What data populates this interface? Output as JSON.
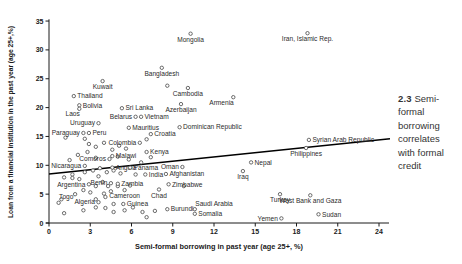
{
  "caption": {
    "number": "2.3",
    "text": "Semi-formal borrowing correlates with formal credit"
  },
  "colors": {
    "axis": "#1a1a1a",
    "tick_text": "#1a1a1a",
    "point_stroke": "#5a5a5a",
    "point_fill": "#ffffff",
    "label_text": "#2b2b2b",
    "trend_line": "#000000",
    "caption_text": "#333333"
  },
  "chart_data": {
    "type": "scatter",
    "title": "",
    "xlabel": "Semi-formal borrowing in past year (age 25+, %)",
    "ylabel": "Loan from a financial institution in the past year (age 25+,%)",
    "xlim": [
      0,
      24
    ],
    "ylim": [
      0,
      35
    ],
    "xticks": [
      0,
      3,
      6,
      9,
      12,
      15,
      18,
      21,
      24
    ],
    "yticks": [
      0,
      5,
      10,
      15,
      20,
      25,
      30,
      35
    ],
    "grid": false,
    "legend": "none",
    "trendline": {
      "x_start": 0,
      "y_start": 8.5,
      "x_end": 24.8,
      "y_end": 14.6
    },
    "points": [
      {
        "name": "Mongolia",
        "x": 10.3,
        "y": 32.8,
        "pos": "below"
      },
      {
        "name": "Iran, Islamic Rep.",
        "x": 18.8,
        "y": 32.9,
        "pos": "below"
      },
      {
        "name": "Bangladesh",
        "x": 8.2,
        "y": 26.9,
        "pos": "below"
      },
      {
        "name": "Kuwait",
        "x": 3.9,
        "y": 24.6,
        "pos": "below"
      },
      {
        "name": "Cambodia",
        "x": 10.1,
        "y": 23.4,
        "pos": "below"
      },
      {
        "name": "Thailand",
        "x": 1.8,
        "y": 22.0,
        "pos": "right"
      },
      {
        "name": "Armenia",
        "x": 13.4,
        "y": 21.8,
        "pos": "below-left"
      },
      {
        "name": "Azerbaijan",
        "x": 9.6,
        "y": 20.6,
        "pos": "below"
      },
      {
        "name": "Bolivia",
        "x": 2.2,
        "y": 20.4,
        "pos": "right"
      },
      {
        "name": "Laos",
        "x": 2.2,
        "y": 19.8,
        "pos": "below-left"
      },
      {
        "name": "Sri Lanka",
        "x": 5.3,
        "y": 19.9,
        "pos": "right"
      },
      {
        "name": "Belarus",
        "x": 6.3,
        "y": 18.4,
        "pos": "left"
      },
      {
        "name": "Vietnam",
        "x": 6.7,
        "y": 18.4,
        "pos": "right"
      },
      {
        "name": "Uruguay",
        "x": 3.6,
        "y": 17.3,
        "pos": "left"
      },
      {
        "name": "Mauritius",
        "x": 5.8,
        "y": 16.5,
        "pos": "right"
      },
      {
        "name": "Dominican Republic",
        "x": 9.5,
        "y": 16.6,
        "pos": "right"
      },
      {
        "name": "Paraguay",
        "x": 2.5,
        "y": 15.6,
        "pos": "left"
      },
      {
        "name": "Peru",
        "x": 2.9,
        "y": 15.6,
        "pos": "right"
      },
      {
        "name": "Croatia",
        "x": 7.4,
        "y": 15.4,
        "pos": "right"
      },
      {
        "name": "Colombia",
        "x": 6.6,
        "y": 13.9,
        "pos": "left"
      },
      {
        "name": "Kenya",
        "x": 7.1,
        "y": 12.3,
        "pos": "right"
      },
      {
        "name": "Malawi",
        "x": 4.6,
        "y": 11.6,
        "pos": "right"
      },
      {
        "name": "Comoros",
        "x": 4.4,
        "y": 11.1,
        "pos": "left"
      },
      {
        "name": "Oman",
        "x": 9.7,
        "y": 9.7,
        "pos": "left"
      },
      {
        "name": "Nicaragua",
        "x": 2.6,
        "y": 9.9,
        "pos": "left"
      },
      {
        "name": "Angola",
        "x": 4.6,
        "y": 9.6,
        "pos": "right"
      },
      {
        "name": "Panama",
        "x": 5.9,
        "y": 9.6,
        "pos": "right"
      },
      {
        "name": "India",
        "x": 7.0,
        "y": 8.4,
        "pos": "right"
      },
      {
        "name": "Afghanistan",
        "x": 8.5,
        "y": 8.5,
        "pos": "right"
      },
      {
        "name": "Argentina",
        "x": 2.9,
        "y": 6.7,
        "pos": "left"
      },
      {
        "name": "Benin",
        "x": 4.5,
        "y": 6.9,
        "pos": "left"
      },
      {
        "name": "Zambia",
        "x": 5.0,
        "y": 6.8,
        "pos": "right"
      },
      {
        "name": "Zimbabwe",
        "x": 8.7,
        "y": 6.7,
        "pos": "right"
      },
      {
        "name": "Cameroon",
        "x": 5.5,
        "y": 5.7,
        "pos": "below"
      },
      {
        "name": "Chad",
        "x": 8.0,
        "y": 5.8,
        "pos": "below"
      },
      {
        "name": "Togo",
        "x": 0.7,
        "y": 3.5,
        "pos": "above-right"
      },
      {
        "name": "Algeria",
        "x": 3.6,
        "y": 3.6,
        "pos": "left"
      },
      {
        "name": "Guinea",
        "x": 5.4,
        "y": 3.3,
        "pos": "right"
      },
      {
        "name": "Burundi",
        "x": 8.6,
        "y": 2.4,
        "pos": "right"
      },
      {
        "name": "Saudi Arabia",
        "x": 10.6,
        "y": 2.4,
        "pos": "above-right"
      },
      {
        "name": "Somalia",
        "x": 10.6,
        "y": 1.6,
        "pos": "right"
      },
      {
        "name": "Nepal",
        "x": 14.7,
        "y": 10.5,
        "pos": "right"
      },
      {
        "name": "Iraq",
        "x": 14.1,
        "y": 9.0,
        "pos": "below"
      },
      {
        "name": "Syrian Arab Republic",
        "x": 18.9,
        "y": 14.4,
        "pos": "right"
      },
      {
        "name": "Philippines",
        "x": 18.7,
        "y": 13.0,
        "pos": "below"
      },
      {
        "name": "Turkey",
        "x": 16.8,
        "y": 5.0,
        "pos": "below"
      },
      {
        "name": "West Bank and Gaza",
        "x": 19.0,
        "y": 4.8,
        "pos": "below"
      },
      {
        "name": "Yemen",
        "x": 16.9,
        "y": 0.8,
        "pos": "left"
      },
      {
        "name": "Sudan",
        "x": 19.6,
        "y": 1.5,
        "pos": "right"
      }
    ],
    "unlabeled_points": [
      [
        8.6,
        23.8
      ],
      [
        7.1,
        14.5
      ],
      [
        1.2,
        14.8
      ],
      [
        2.6,
        14.6
      ],
      [
        2.9,
        13.7
      ],
      [
        3.4,
        13.2
      ],
      [
        4.0,
        13.9
      ],
      [
        4.6,
        12.7
      ],
      [
        5.1,
        13.4
      ],
      [
        5.6,
        12.9
      ],
      [
        2.8,
        12.3
      ],
      [
        2.1,
        11.8
      ],
      [
        1.5,
        10.9
      ],
      [
        3.4,
        11.3
      ],
      [
        5.0,
        11.5
      ],
      [
        5.8,
        11.0
      ],
      [
        6.7,
        10.5
      ],
      [
        7.4,
        11.4
      ],
      [
        3.7,
        9.5
      ],
      [
        3.2,
        9.1
      ],
      [
        2.6,
        8.8
      ],
      [
        1.7,
        8.4
      ],
      [
        4.2,
        8.8
      ],
      [
        4.7,
        9.1
      ],
      [
        5.2,
        8.6
      ],
      [
        6.3,
        8.4
      ],
      [
        1.1,
        7.9
      ],
      [
        3.6,
        8.1
      ],
      [
        1.7,
        7.8
      ],
      [
        2.2,
        7.6
      ],
      [
        3.9,
        7.1
      ],
      [
        3.4,
        6.4
      ],
      [
        4.3,
        6.4
      ],
      [
        5.0,
        6.4
      ],
      [
        5.9,
        6.5
      ],
      [
        4.5,
        5.5
      ],
      [
        4.0,
        5.1
      ],
      [
        3.0,
        5.3
      ],
      [
        2.5,
        5.7
      ],
      [
        1.9,
        5.0
      ],
      [
        9.8,
        6.4
      ],
      [
        0.9,
        4.1
      ],
      [
        3.4,
        4.1
      ],
      [
        4.1,
        4.5
      ],
      [
        4.7,
        3.3
      ],
      [
        3.4,
        2.7
      ],
      [
        2.5,
        2.2
      ],
      [
        1.1,
        1.7
      ],
      [
        4.1,
        2.6
      ],
      [
        4.7,
        1.9
      ],
      [
        5.5,
        2.2
      ],
      [
        6.1,
        2.7
      ],
      [
        6.8,
        1.9
      ],
      [
        7.1,
        1.0
      ],
      [
        7.7,
        2.1
      ]
    ]
  }
}
